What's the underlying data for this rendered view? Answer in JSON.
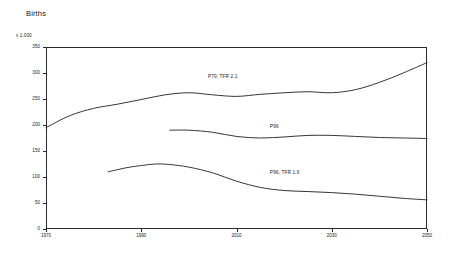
{
  "chart_data": {
    "type": "line",
    "title": "Births",
    "unit_label": "x 1,000",
    "xlabel": "",
    "ylabel": "",
    "xlim": [
      1970,
      2050
    ],
    "ylim": [
      0,
      350
    ],
    "grid": false,
    "legend_position": "inline-annotation",
    "xticks": [
      "1970",
      "1990",
      "2010",
      "2030",
      "2050"
    ],
    "xtick_values": [
      1970,
      1990,
      2010,
      2030,
      2050
    ],
    "yticks": [
      "0",
      "50",
      "100",
      "150",
      "200",
      "250",
      "300",
      "350"
    ],
    "ytick_values": [
      0,
      50,
      100,
      150,
      200,
      250,
      300,
      350
    ],
    "series": [
      {
        "name": "P70, TFR 2.1",
        "label": "P70, TFR 2.1",
        "x": [
          1970,
          1975,
          1980,
          1985,
          1990,
          1995,
          2000,
          2005,
          2010,
          2015,
          2020,
          2025,
          2030,
          2035,
          2040,
          2045,
          2050
        ],
        "values": [
          195,
          218,
          232,
          240,
          249,
          258,
          262,
          258,
          255,
          259,
          262,
          264,
          262,
          268,
          282,
          300,
          320
        ]
      },
      {
        "name": "P96",
        "label": "P96",
        "x": [
          1996,
          2000,
          2005,
          2010,
          2015,
          2020,
          2025,
          2030,
          2035,
          2040,
          2045,
          2050
        ],
        "values": [
          190,
          190,
          186,
          178,
          175,
          177,
          180,
          180,
          178,
          176,
          175,
          174
        ]
      },
      {
        "name": "P96, TFR 1.6",
        "label": "P96, TFR 1.6",
        "x": [
          1983,
          1987,
          1990,
          1993,
          1996,
          2000,
          2005,
          2010,
          2015,
          2020,
          2025,
          2030,
          2035,
          2040,
          2045,
          2050
        ],
        "values": [
          110,
          118,
          122,
          125,
          124,
          119,
          108,
          92,
          80,
          74,
          72,
          70,
          67,
          63,
          59,
          56
        ]
      }
    ],
    "annotations": [
      {
        "text": "P70, TFR 2.1",
        "x": 2004,
        "y": 292
      },
      {
        "text": "P96",
        "x": 2017,
        "y": 196
      },
      {
        "text": "P96, TFR 1.6",
        "x": 2017,
        "y": 106
      }
    ]
  }
}
